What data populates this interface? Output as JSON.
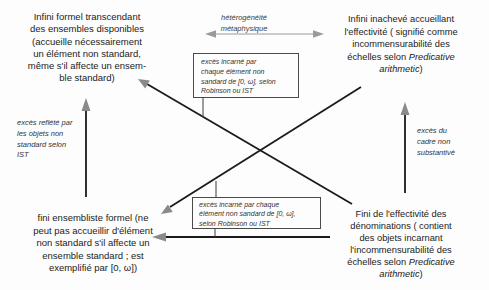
{
  "diagram": {
    "top_left": {
      "text": "Infini formel transcendant\ndes ensembles disponibles\n(accueille nécessairement\nun élément non standard,\nmême s'il affecte un ensem-\nble standard)"
    },
    "top_right": {
      "pre": "Infini inachevé accueillant\nl'effectivité ( signifié comme\nincommensurabilité des\néchelles selon ",
      "italic": "Predicative\narithmetic",
      "post": ")"
    },
    "bottom_left": {
      "text": "fini ensembliste formel (ne\npeut pas accueillir d'élément\nnon standard s'il affecte un\nensemble standard ; est\nexemplifié par [0, ω])"
    },
    "bottom_right": {
      "pre": "Fini de l'effectivité des\ndénominations ( contient\ndes objets incarnant\nl'incommensurabilité des\néchelles selon ",
      "italic": "Predicative\narithmetic",
      "post": ")"
    },
    "center_label": {
      "text": "hétérogénéité\nmétaphysique"
    },
    "left_label": {
      "text": "excès reflété par\nles objets non\nstandard selon\nIST"
    },
    "right_label": {
      "text": "excès du\ncadre non\nsubstantivé"
    },
    "top_box": {
      "text": "excès incarné par\nchaque élément non\nsandard de [0, ω], selon\nRobinson ou IST"
    },
    "bottom_box": {
      "text": "excès incarné par chaque\nélément non sandard de [0, ω],\nselon Robinson ou IST"
    },
    "colors": {
      "text": "#1e1e1e",
      "arrow_shaft": "#1a1a1a",
      "arrow_head": "#8a8a8a",
      "double_arrow": "#9a9a9a",
      "box_border": "#4a4a4a",
      "background": "#fdfdfd"
    }
  }
}
